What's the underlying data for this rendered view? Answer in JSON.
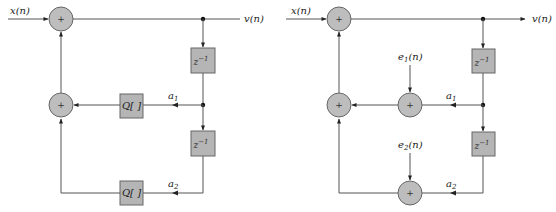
{
  "figure": {
    "left_diagram": {
      "input_label": "x(n)",
      "output_label": "v(n)",
      "adder_symbol": "+",
      "delay_label_1": "z",
      "delay_label_2": "z",
      "delay_exponent": "−1",
      "quantizer_1": "Q[ ]",
      "quantizer_2": "Q[ ]",
      "coef_1": "a",
      "coef_1_sub": "1",
      "coef_2": "a",
      "coef_2_sub": "2"
    },
    "right_diagram": {
      "input_label": "x(n)",
      "output_label": "v(n)",
      "adder_symbol": "+",
      "delay_label_1": "z",
      "delay_label_2": "z",
      "delay_exponent": "−1",
      "noise_1": "e",
      "noise_1_sub": "1",
      "noise_1_arg": "(n)",
      "noise_2": "e",
      "noise_2_sub": "2",
      "noise_2_arg": "(n)",
      "coef_1": "a",
      "coef_1_sub": "1",
      "coef_2": "a",
      "coef_2_sub": "2"
    }
  }
}
